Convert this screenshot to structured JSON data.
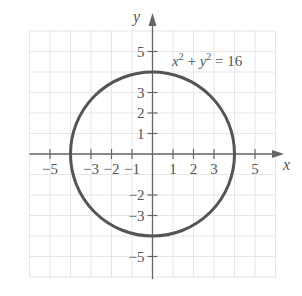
{
  "chart_data": {
    "type": "line",
    "title": "",
    "xlabel": "x",
    "ylabel": "y",
    "xlim": [
      -6,
      6
    ],
    "ylim": [
      -6,
      6
    ],
    "grid": true,
    "x_ticks": [
      -5,
      -3,
      -2,
      -1,
      1,
      2,
      3,
      5
    ],
    "y_ticks": [
      5,
      3,
      2,
      1,
      -2,
      -3,
      -5
    ],
    "x_tick_labels": [
      "−5",
      "−3",
      "−2",
      "−1",
      "1",
      "2",
      "3",
      "5"
    ],
    "y_tick_labels": [
      "5",
      "3",
      "2",
      "1",
      "−2",
      "−3",
      "−5"
    ],
    "series": [
      {
        "name": "x^2 + y^2 = 16",
        "shape": "circle",
        "center": [
          0,
          0
        ],
        "radius": 4,
        "color": "#555555"
      }
    ],
    "annotations": [
      {
        "text": "x² + y² = 16",
        "position": [
          3.5,
          4.9
        ]
      }
    ]
  },
  "labels": {
    "x_axis": "x",
    "y_axis": "y",
    "equation_x": "x",
    "equation_plus": " + ",
    "equation_y": "y",
    "equation_eq": " = 16",
    "exp": "2"
  },
  "colors": {
    "grid": "#e6e6e6",
    "axis": "#666666",
    "curve": "#555555",
    "text": "#555555"
  }
}
